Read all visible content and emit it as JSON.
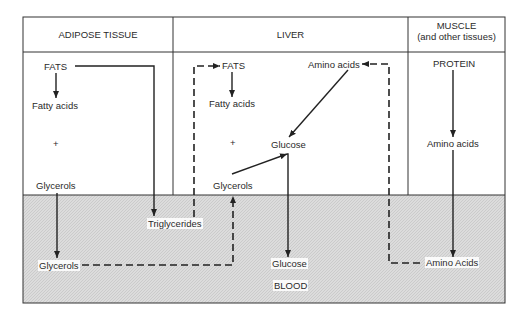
{
  "headers": {
    "adipose": "ADIPOSE TISSUE",
    "liver": "LIVER",
    "muscle_line1": "MUSCLE",
    "muscle_line2": "(and other tissues)"
  },
  "adipose": {
    "fats": "FATS",
    "fatty_acids": "Fatty acids",
    "plus": "+",
    "glycerols": "Glycerols"
  },
  "liver": {
    "fats": "FATS",
    "fatty_acids": "Fatty acids",
    "plus": "+",
    "glucose": "Glucose",
    "glycerols": "Glycerols",
    "amino_acids": "Amino acids"
  },
  "muscle": {
    "protein": "PROTEIN",
    "amino_acids": "Amino acids"
  },
  "blood": {
    "label": "BLOOD",
    "glycerols": "Glycerols",
    "triglycerides": "Triglycerides",
    "glucose": "Glucose",
    "amino_acids": "Amino Acids"
  },
  "colors": {
    "line": "#222222",
    "blood_fill": "#d9d9d9"
  }
}
